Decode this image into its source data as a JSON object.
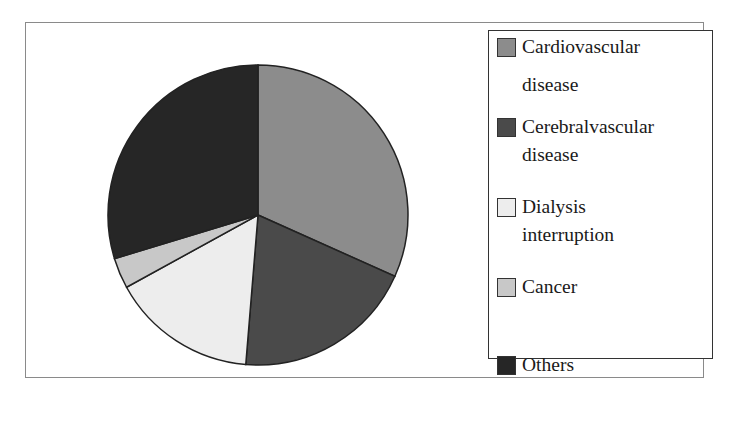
{
  "chart_data": {
    "type": "pie",
    "title": "",
    "categories": [
      "Cardiovascular disease",
      "Cerebralvascular disease",
      "Dialysis interruption",
      "Cancer",
      "Others"
    ],
    "values": [
      31.7,
      19.6,
      15.7,
      3.3,
      29.7
    ],
    "unit": "percent (estimated from slice angles)",
    "colors": [
      "#8c8c8c",
      "#4a4a4a",
      "#ededed",
      "#c8c8c8",
      "#262626"
    ],
    "start_angle_deg": 0,
    "direction": "clockwise",
    "legend_position": "right"
  },
  "legend": {
    "items": [
      {
        "line1": "Cardiovascular",
        "line2": "disease",
        "color": "#8c8c8c"
      },
      {
        "line1": "Cerebralvascular",
        "line2": "disease",
        "color": "#4a4a4a"
      },
      {
        "line1": "Dialysis",
        "line2": "interruption",
        "color": "#ededed"
      },
      {
        "line1": "Cancer",
        "line2": "",
        "color": "#c8c8c8"
      },
      {
        "line1": "Others",
        "line2": "",
        "color": "#262626"
      }
    ]
  }
}
